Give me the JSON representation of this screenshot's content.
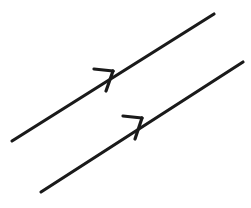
{
  "figure": {
    "background_color": "#ffffff",
    "stroke_color": "#1a1a1a",
    "canvas": {
      "width": 251,
      "height": 208
    }
  },
  "style": {
    "shaft_stroke_width": 3.2,
    "barb_stroke_width": 3.2,
    "line_cap": "round"
  },
  "vectors": [
    {
      "id": "vector-upper",
      "label": "Upper vector",
      "direction": "up-right",
      "start": {
        "x": 12,
        "y": 141
      },
      "end": {
        "x": 214,
        "y": 14
      },
      "arrow": {
        "tip": {
          "x": 113,
          "y": 71
        },
        "barb_upper_end": {
          "x": 94,
          "y": 69
        },
        "barb_lower_end": {
          "x": 106,
          "y": 91
        }
      }
    },
    {
      "id": "vector-lower",
      "label": "Lower vector",
      "direction": "up-right",
      "start": {
        "x": 41,
        "y": 192
      },
      "end": {
        "x": 243,
        "y": 62
      },
      "arrow": {
        "tip": {
          "x": 142,
          "y": 118
        },
        "barb_upper_end": {
          "x": 123,
          "y": 116
        },
        "barb_lower_end": {
          "x": 135,
          "y": 139
        }
      }
    }
  ]
}
